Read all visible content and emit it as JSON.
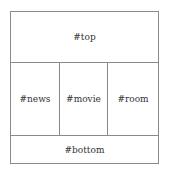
{
  "layout": {
    "top": {
      "label": "#top"
    },
    "middle": [
      {
        "label": "#news"
      },
      {
        "label": "#movie"
      },
      {
        "label": "#room"
      }
    ],
    "bottom": {
      "label": "#bottom"
    }
  },
  "colors": {
    "border": "#8a8a8a",
    "text": "#333333",
    "background": "#ffffff"
  }
}
